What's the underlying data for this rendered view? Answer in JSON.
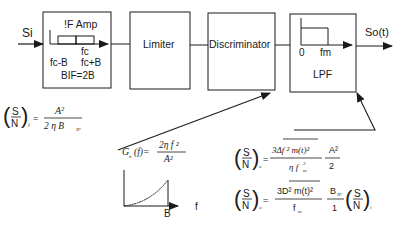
{
  "blocks": {
    "if_amp": {
      "title": "!F Amp",
      "fc": "fc",
      "fc_minus_b": "fc-B",
      "fc_plus_b": "fc+B",
      "bif": "BIF=2B"
    },
    "limiter": {
      "title": "Limiter"
    },
    "discriminator": {
      "title": "Discriminator"
    },
    "lpf": {
      "title": "LPF",
      "zero": "0",
      "fm": "fm"
    }
  },
  "signals": {
    "input": "Si",
    "output": "So(t)"
  },
  "equations": {
    "snr_in": {
      "lhs_s": "S",
      "lhs_n": "N",
      "sub": "i",
      "num": "A²",
      "den": "2 η B",
      "den_sub": "IF"
    },
    "noise_psd": {
      "lhs": "G",
      "lhs_sub": "n",
      "arg": "(f)=",
      "num": "2η f ²",
      "den": "A²"
    },
    "snr_out_1": {
      "lhs_s": "S",
      "lhs_n": "N",
      "sub": "o",
      "num": "3Δf ² m(t)²",
      "den": "η f",
      "den_sub": "m",
      "den_sup": "3",
      "factor_num": "A²",
      "factor_den": "2"
    },
    "snr_out_2": {
      "lhs_s": "S",
      "lhs_n": "N",
      "sub": "o",
      "num": "3D² m(t)²",
      "den": "f",
      "den_sub": "m",
      "mid_num": "B",
      "mid_num_sub": "IF",
      "mid_den": "1",
      "rhs_s": "S",
      "rhs_n": "N",
      "rhs_sub": "i"
    }
  },
  "psd_plot": {
    "x_label": "f",
    "x_tick": "B"
  }
}
